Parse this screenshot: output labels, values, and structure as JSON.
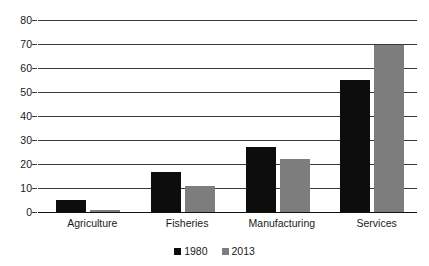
{
  "chart_data": {
    "type": "bar",
    "title": "",
    "subtitle": "",
    "xlabel": "",
    "ylabel": "",
    "categories": [
      "Agriculture",
      "Fisheries",
      "Manufacturing",
      "Services"
    ],
    "series": [
      {
        "name": "1980",
        "color": "#0d0d0d",
        "values": [
          5,
          16.5,
          27,
          55
        ]
      },
      {
        "name": "2013",
        "color": "#7d7d7d",
        "values": [
          1,
          11,
          22,
          69.5
        ]
      }
    ],
    "ylim": [
      0,
      80
    ],
    "ytick_step": 10,
    "yticks": [
      "80",
      "70",
      "60",
      "50",
      "40",
      "30",
      "20",
      "10",
      "0"
    ],
    "grid": true,
    "grid_axis": "y",
    "legend_position": "bottom",
    "annotations": []
  },
  "legend": {
    "items": [
      {
        "label": "1980",
        "color": "#0d0d0d",
        "swatch": "square-marker"
      },
      {
        "label": "2013",
        "color": "#7d7d7d",
        "swatch": "square-marker"
      }
    ]
  }
}
